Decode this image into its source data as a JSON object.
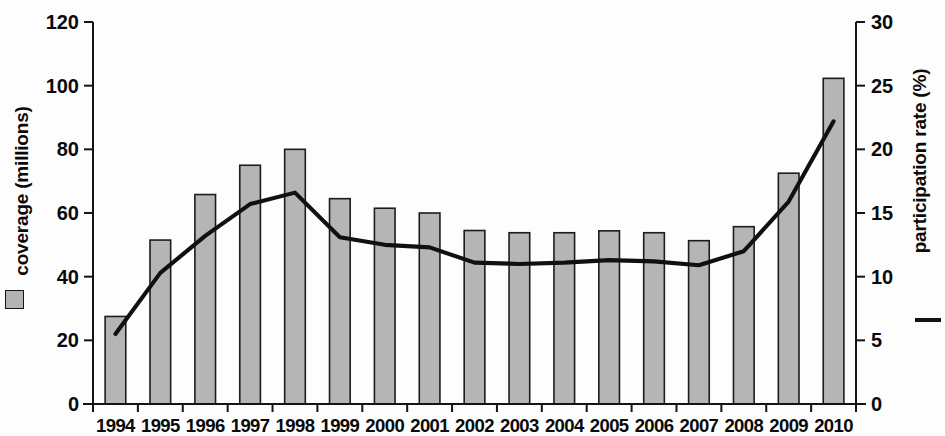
{
  "chart_data": {
    "type": "bar",
    "title": "",
    "subtitle": "",
    "xlabel": "",
    "ylabel": "coverage (millions)",
    "y2label": "participation rate (%)",
    "categories": [
      "1994",
      "1995",
      "1996",
      "1997",
      "1998",
      "1999",
      "2000",
      "2001",
      "2002",
      "2003",
      "2004",
      "2005",
      "2006",
      "2007",
      "2008",
      "2009",
      "2010"
    ],
    "ylim": [
      0,
      120
    ],
    "y2lim": [
      0,
      30
    ],
    "yticks": [
      0,
      20,
      40,
      60,
      80,
      100,
      120
    ],
    "y2ticks": [
      0,
      5,
      10,
      15,
      20,
      25,
      30
    ],
    "grid": false,
    "legend_position": "axis-titles",
    "series": [
      {
        "name": "coverage (millions)",
        "type": "bar",
        "axis": "left",
        "marker": "filled-square",
        "color": "#b5b5b5",
        "values": [
          27.5,
          51.5,
          65.8,
          75.0,
          80.0,
          64.5,
          61.5,
          60.0,
          54.5,
          53.8,
          53.8,
          54.4,
          53.8,
          51.3,
          55.7,
          72.5,
          102.3
        ]
      },
      {
        "name": "participation rate (%)",
        "type": "line",
        "axis": "right",
        "marker": "line",
        "color": "#101010",
        "values": [
          5.5,
          10.3,
          13.2,
          15.7,
          16.6,
          13.1,
          12.5,
          12.3,
          11.1,
          11.0,
          11.1,
          11.3,
          11.2,
          10.9,
          12.0,
          15.9,
          22.2
        ]
      }
    ]
  },
  "axes": {
    "left": {
      "title": "coverage (millions)",
      "tick_labels": [
        "120",
        "100",
        "80",
        "60",
        "40",
        "20",
        "0"
      ]
    },
    "right": {
      "title": "participation rate (%)",
      "tick_labels": [
        "30",
        "25",
        "20",
        "15",
        "10",
        "5",
        "0"
      ]
    },
    "bottom": {
      "tick_labels": [
        "1994",
        "1995",
        "1996",
        "1997",
        "1998",
        "1999",
        "2000",
        "2001",
        "2002",
        "2003",
        "2004",
        "2005",
        "2006",
        "2007",
        "2008",
        "2009",
        "2010"
      ]
    }
  },
  "colors": {
    "bar_fill": "#b5b5b5",
    "bar_stroke": "#1c1c1c",
    "line": "#101010",
    "axis": "#141414",
    "text": "#0a0a0a",
    "background": "#fdfdfd"
  }
}
